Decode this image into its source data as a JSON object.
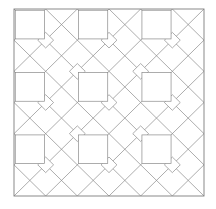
{
  "figure": {
    "name": "geometric-quilt-tessellation",
    "width": 216,
    "height": 209,
    "background_color": "#ffffff"
  },
  "style": {
    "line_color": "#8a8a8a",
    "border_color": "#7d7d7d",
    "line_width": 0.7,
    "border_width": 0.9,
    "fill": "none"
  },
  "frame": {
    "x": 14,
    "y": 9,
    "width": 190,
    "height": 187
  },
  "grid": {
    "columns": 6,
    "rows": 6,
    "cell_width": 31.667,
    "cell_height": 31.167
  },
  "chart_data": {
    "type": "diagram",
    "title": "",
    "motifs": [
      {
        "name": "plain-square",
        "parity": "even",
        "cells": [
          [
            0,
            0
          ],
          [
            2,
            0
          ],
          [
            4,
            0
          ],
          [
            0,
            2
          ],
          [
            2,
            2
          ],
          [
            4,
            2
          ],
          [
            0,
            4
          ],
          [
            2,
            4
          ],
          [
            4,
            4
          ]
        ],
        "inset": 0.04
      },
      {
        "name": "large-diamond",
        "description": "Rotated square centered at odd grid intersections, spanning two cells.",
        "centers": [
          [
            2,
            2
          ],
          [
            4,
            2
          ],
          [
            6,
            2
          ],
          [
            2,
            4
          ],
          [
            4,
            4
          ],
          [
            6,
            4
          ]
        ]
      },
      {
        "name": "small-diamond",
        "description": "Quarter-cell diamonds clustered at lattice crossing points.",
        "size_ratio": 0.5
      }
    ],
    "diagonal_lattice": {
      "angle_degrees": 45,
      "families": 2,
      "spacing_cells": 1
    }
  }
}
